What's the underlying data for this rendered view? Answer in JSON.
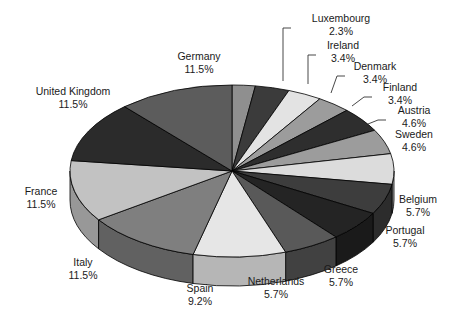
{
  "chart_data": {
    "type": "pie",
    "title": "",
    "subtitle": "",
    "xlabel": "",
    "ylabel": "",
    "legend_position": "labels-outside-with-leader-lines",
    "grid": false,
    "three_d": true,
    "units": "%",
    "categories": [
      "Luxembourg",
      "Ireland",
      "Denmark",
      "Finland",
      "Austria",
      "Sweden",
      "Belgium",
      "Portugal",
      "Greece",
      "Netherlands",
      "Spain",
      "Italy",
      "France",
      "United Kingdom",
      "Germany"
    ],
    "values": [
      2.3,
      3.4,
      3.4,
      3.4,
      4.6,
      4.6,
      5.7,
      5.7,
      5.7,
      5.7,
      9.2,
      11.5,
      11.5,
      11.5,
      11.5
    ],
    "slices": [
      {
        "name": "Luxembourg",
        "value": 2.3,
        "label": "Luxembourg",
        "pct": "2.3%",
        "color": "#8f8f8f",
        "side_color": "#6e6e6e",
        "label_x": 341,
        "label_y": 22,
        "pct_x": 341,
        "pct_y": 35,
        "anchor": "middle",
        "leader": "M 291,28 L 283,28 L 283,81"
      },
      {
        "name": "Ireland",
        "value": 3.4,
        "label": "Ireland",
        "pct": "3.4%",
        "color": "#3b3b3b",
        "side_color": "#2b2b2b",
        "label_x": 343,
        "label_y": 49,
        "pct_x": 343,
        "pct_y": 62,
        "anchor": "middle",
        "leader": "M 316,55 L 308,55 L 308,84"
      },
      {
        "name": "Denmark",
        "value": 3.4,
        "label": "Denmark",
        "pct": "3.4%",
        "color": "#e3e3e3",
        "side_color": "#b4b4b4",
        "label_x": 375,
        "label_y": 70,
        "pct_x": 375,
        "pct_y": 83,
        "anchor": "middle",
        "leader": "M 345,76 L 337,76 L 331,93"
      },
      {
        "name": "Finland",
        "value": 3.4,
        "label": "Finland",
        "pct": "3.4%",
        "color": "#9c9c9c",
        "side_color": "#767676",
        "label_x": 400,
        "label_y": 91,
        "pct_x": 400,
        "pct_y": 104,
        "anchor": "middle",
        "leader": "M 372,97 L 364,97 L 352,106"
      },
      {
        "name": "Austria",
        "value": 4.6,
        "label": "Austria",
        "pct": "4.6%",
        "color": "#2e2e2e",
        "side_color": "#202020",
        "label_x": 414,
        "label_y": 114,
        "pct_x": 414,
        "pct_y": 127,
        "anchor": "middle",
        "leader": "M 386,120 L 378,120 L 368,124"
      },
      {
        "name": "Sweden",
        "value": 4.6,
        "label": "Sweden",
        "pct": "4.6%",
        "color": "#9c9c9c",
        "side_color": "#767676",
        "label_x": 414,
        "label_y": 138,
        "pct_x": 414,
        "pct_y": 151,
        "anchor": "middle",
        "leader": ""
      },
      {
        "name": "Belgium",
        "value": 5.7,
        "label": "Belgium",
        "pct": "5.7%",
        "color": "#dcdcdc",
        "side_color": "#aeaeae",
        "label_x": 418,
        "label_y": 203,
        "pct_x": 418,
        "pct_y": 216,
        "anchor": "middle",
        "leader": ""
      },
      {
        "name": "Portugal",
        "value": 5.7,
        "label": "Portugal",
        "pct": "5.7%",
        "color": "#3d3d3d",
        "side_color": "#2c2c2c",
        "label_x": 405,
        "label_y": 234,
        "pct_x": 405,
        "pct_y": 247,
        "anchor": "middle",
        "leader": ""
      },
      {
        "name": "Greece",
        "value": 5.7,
        "label": "Greece",
        "pct": "5.7%",
        "color": "#242424",
        "side_color": "#1a1a1a",
        "label_x": 341,
        "label_y": 273,
        "pct_x": 341,
        "pct_y": 286,
        "anchor": "middle",
        "leader": ""
      },
      {
        "name": "Netherlands",
        "value": 5.7,
        "label": "Netherlands",
        "pct": "5.7%",
        "color": "#595959",
        "side_color": "#414141",
        "label_x": 276,
        "label_y": 285,
        "pct_x": 276,
        "pct_y": 298,
        "anchor": "middle",
        "leader": ""
      },
      {
        "name": "Spain",
        "value": 9.2,
        "label": "Spain",
        "pct": "9.2%",
        "color": "#e6e6e6",
        "side_color": "#b6b6b6",
        "label_x": 200,
        "label_y": 292,
        "pct_x": 200,
        "pct_y": 305,
        "anchor": "middle",
        "leader": ""
      },
      {
        "name": "Italy",
        "value": 11.5,
        "label": "Italy",
        "pct": "11.5%",
        "color": "#7f7f7f",
        "side_color": "#616161",
        "label_x": 83,
        "label_y": 266,
        "pct_x": 83,
        "pct_y": 279,
        "anchor": "middle",
        "leader": ""
      },
      {
        "name": "France",
        "value": 11.5,
        "label": "France",
        "pct": "11.5%",
        "color": "#c2c2c2",
        "side_color": "#989898",
        "label_x": 41,
        "label_y": 195,
        "pct_x": 41,
        "pct_y": 208,
        "anchor": "middle",
        "leader": ""
      },
      {
        "name": "United Kingdom",
        "value": 11.5,
        "label": "United Kingdom",
        "pct": "11.5%",
        "color": "#2b2b2b",
        "side_color": "#1e1e1e",
        "label_x": 73,
        "label_y": 95,
        "pct_x": 73,
        "pct_y": 108,
        "anchor": "middle",
        "leader": ""
      },
      {
        "name": "Germany",
        "value": 11.5,
        "label": "Germany",
        "pct": "11.5%",
        "color": "#5c5c5c",
        "side_color": "#434343",
        "label_x": 199,
        "label_y": 60,
        "pct_x": 199,
        "pct_y": 73,
        "anchor": "middle",
        "leader": ""
      }
    ],
    "geometry": {
      "cx": 232,
      "cy": 171,
      "rx": 162,
      "ry": 86,
      "depth": 29,
      "start_angle_deg": -90
    }
  }
}
